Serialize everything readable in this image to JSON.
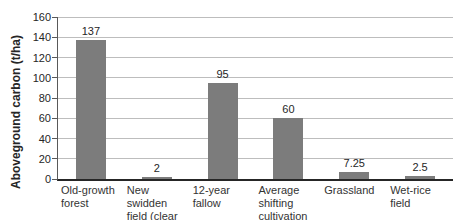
{
  "chart_data": {
    "type": "bar",
    "title": "",
    "xlabel": "",
    "ylabel": "Aboveground carbon (t/ha)",
    "categories": [
      "Old-growth forest",
      "New swidden field (clear cut)",
      "12-year fallow",
      "Average shifting cultivation land",
      "Grassland",
      "Wet-rice field"
    ],
    "category_lines": [
      [
        "Old-growth",
        "forest"
      ],
      [
        "New swidden",
        "field (clear cut)"
      ],
      [
        "12-year",
        "fallow"
      ],
      [
        "Average shifting",
        "cultivation land"
      ],
      [
        "Grassland"
      ],
      [
        "Wet-rice",
        "field"
      ]
    ],
    "values": [
      137,
      2,
      95,
      60,
      7.25,
      2.5
    ],
    "value_labels": [
      "137",
      "2",
      "95",
      "60",
      "7.25",
      "2.5"
    ],
    "ylim": [
      0,
      160
    ],
    "yticks": [
      0,
      20,
      40,
      60,
      80,
      100,
      120,
      140,
      160
    ],
    "grid": "horizontal",
    "legend": "none",
    "bar_color": "#7c7c7c",
    "gridline_color": "#bdbdbd",
    "axis_color": "#262626",
    "text_color": "#333333",
    "background_color": "#ffffff"
  }
}
